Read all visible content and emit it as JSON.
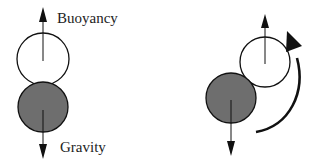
{
  "diagram": {
    "left": {
      "buoyancy_label": "Buoyancy",
      "gravity_label": "Gravity",
      "upper_bubble": {
        "cx": 43,
        "cy": 59,
        "r": 26,
        "fill": "#ffffff"
      },
      "lower_body": {
        "cx": 43,
        "cy": 107,
        "r": 25,
        "fill": "#6e6e6e"
      }
    },
    "right": {
      "upper_bubble": {
        "cx": 265,
        "cy": 62,
        "r": 25,
        "fill": "#ffffff"
      },
      "lower_body": {
        "cx": 231,
        "cy": 98,
        "r": 25,
        "fill": "#6e6e6e"
      },
      "rotation_arrow": "counterclockwise-rotation"
    },
    "colors": {
      "stroke": "#111111",
      "gray_fill": "#6e6e6e"
    }
  }
}
